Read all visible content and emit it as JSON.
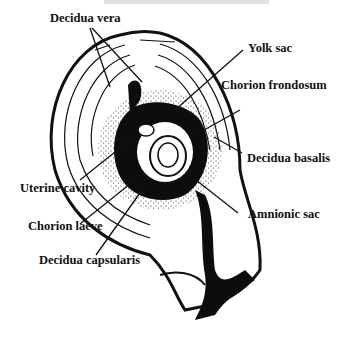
{
  "diagram": {
    "title_visible": false,
    "colors": {
      "ink": "#111111",
      "background": "#ffffff"
    },
    "labels": {
      "decidua_vera": "Decidua vera",
      "yolk_sac": "Yolk sac",
      "chorion_frondosum": "Chorion frondosum",
      "decidua_basalis": "Decidua basalis",
      "uterine_cavity": "Uterine cavity",
      "amnionic_sac": "Amnionic sac",
      "chorion_laeve": "Chorion laeve",
      "decidua_capsularis": "Decidua capsularis"
    }
  }
}
